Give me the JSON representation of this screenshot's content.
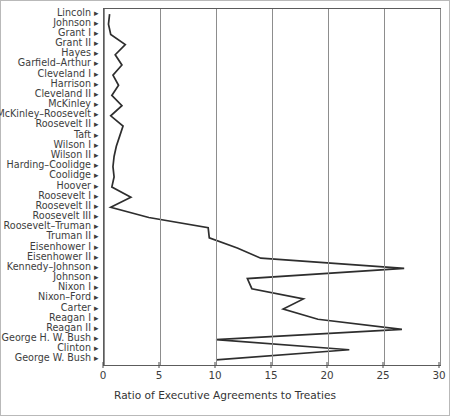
{
  "chart_data": {
    "type": "line",
    "title": "",
    "xlabel": "Ratio of Executive Agreements to Treaties",
    "ylabel": "",
    "orientation": "horizontal",
    "grid": true,
    "legend": false,
    "xlim": [
      0,
      30
    ],
    "xticks": [
      0,
      5,
      10,
      15,
      20,
      25,
      30
    ],
    "xtick_labels": [
      "0",
      "5",
      "10",
      "15",
      "20",
      "25",
      "30"
    ],
    "categories": [
      "Lincoln",
      "Johnson",
      "Grant I",
      "Grant II",
      "Hayes",
      "Garfield–Arthur",
      "Cleveland I",
      "Harrison",
      "Cleveland II",
      "McKinley",
      "McKinley–Roosevelt",
      "Roosevelt II",
      "Taft",
      "Wilson I",
      "Wilson II",
      "Harding–Coolidge",
      "Coolidge",
      "Hoover",
      "Roosevelt I",
      "Roosevelt II",
      "Roosevelt III",
      "Roosevelt–Truman",
      "Truman II",
      "Eisenhower I",
      "Eisenhower II",
      "Kennedy–Johnson",
      "Johnson",
      "Nixon I",
      "Nixon–Ford",
      "Carter",
      "Reagan I",
      "Reagan II",
      "George H. W. Bush",
      "Clinton",
      "George W. Bush"
    ],
    "values": [
      0.5,
      0.4,
      0.6,
      1.9,
      1.0,
      1.6,
      0.8,
      1.3,
      0.7,
      1.6,
      0.6,
      1.7,
      1.4,
      1.1,
      0.9,
      0.8,
      0.9,
      0.7,
      2.4,
      0.6,
      4.0,
      9.3,
      9.4,
      11.9,
      14.0,
      26.8,
      12.8,
      13.2,
      17.8,
      16.0,
      19.1,
      26.6,
      10.0,
      21.9,
      10.0
    ]
  },
  "axis": {
    "tick_arrow_glyph": "▸"
  }
}
